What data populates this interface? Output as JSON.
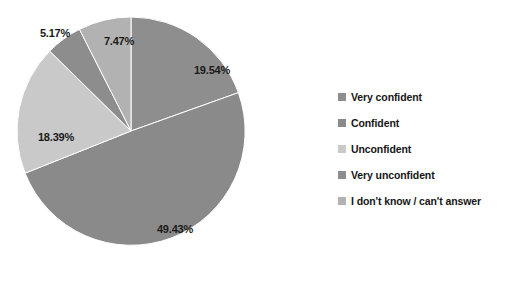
{
  "chart_data": {
    "type": "pie",
    "title": "",
    "xlabel": "",
    "ylabel": "",
    "grid": false,
    "legend_position": "right",
    "start_angle_deg": 0,
    "direction": "clockwise",
    "categories": [
      "Very confident",
      "Confident",
      "Unconfident",
      "Very unconfident",
      "I don't know / can't answer"
    ],
    "values": [
      19.54,
      49.43,
      18.39,
      5.17,
      7.47
    ],
    "data_labels": [
      "19.54%",
      "49.43%",
      "18.39%",
      "5.17%",
      "7.47%"
    ],
    "colors": [
      "#8e8e8e",
      "#8a8a8a",
      "#c9c9c9",
      "#8d8d8d",
      "#b2b2b2"
    ],
    "units": "percent"
  },
  "pie": {
    "labels": [
      {
        "text": "19.54%",
        "x": 212,
        "y": 70
      },
      {
        "text": "49.43%",
        "x": 175,
        "y": 229
      },
      {
        "text": "18.39%",
        "x": 56,
        "y": 137
      },
      {
        "text": "5.17%",
        "x": 55,
        "y": 33
      },
      {
        "text": "7.47%",
        "x": 119,
        "y": 41
      }
    ]
  },
  "legend": {
    "items": [
      {
        "label": "Very confident",
        "color": "#8e8e8e"
      },
      {
        "label": "Confident",
        "color": "#8a8a8a"
      },
      {
        "label": "Unconfident",
        "color": "#c9c9c9"
      },
      {
        "label": "Very unconfident",
        "color": "#8d8d8d"
      },
      {
        "label": "I don't know / can't answer",
        "color": "#b2b2b2"
      }
    ]
  }
}
